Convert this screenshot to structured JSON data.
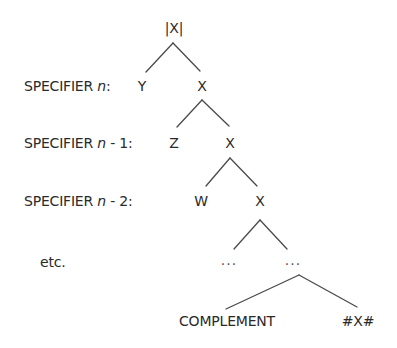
{
  "diagram": {
    "root": {
      "label": "|X|"
    },
    "specifiers": [
      {
        "prefix": "SPECIFIER ",
        "var": "n",
        "suffix": ":",
        "node": "Y",
        "head": "X"
      },
      {
        "prefix": "SPECIFIER ",
        "var": "n",
        "suffix": " - 1:",
        "node": "Z",
        "head": "X"
      },
      {
        "prefix": "SPECIFIER ",
        "var": "n",
        "suffix": " - 2:",
        "node": "W",
        "head": "X"
      }
    ],
    "etc": {
      "label": "etc.",
      "left_dots": "...",
      "right_dots": "..."
    },
    "bottom": {
      "complement": "COMPLEMENT",
      "head": "#X#"
    },
    "line_color": "#4a4a4a",
    "text_color": "#2a2a2a"
  }
}
